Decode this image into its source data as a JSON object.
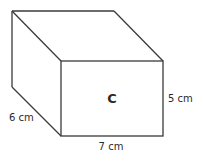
{
  "diagram": {
    "type": "cuboid",
    "face_label": "C",
    "dimensions": {
      "depth": "6 cm",
      "width": "7 cm",
      "height": "5 cm"
    },
    "colors": {
      "stroke": "#3a3a3a",
      "text": "#2a2a2a",
      "background": "#ffffff"
    }
  }
}
